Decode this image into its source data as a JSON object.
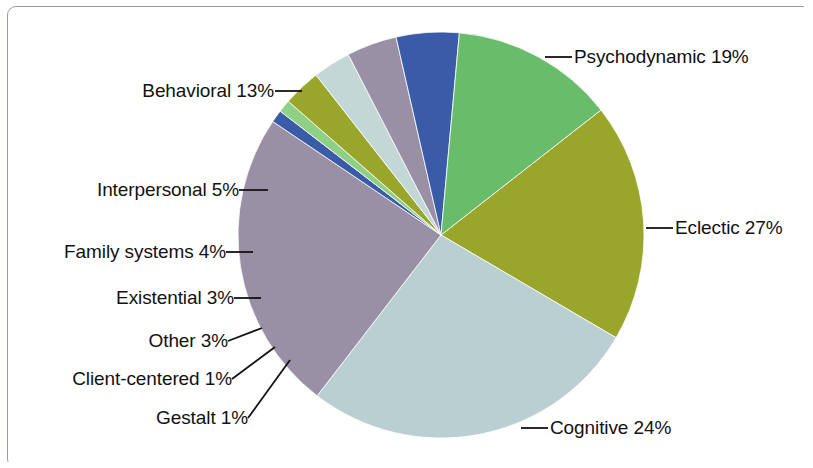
{
  "chart_data": {
    "type": "pie",
    "title": "",
    "subtitle": "",
    "xlabel": "",
    "ylabel": "",
    "grid": false,
    "legend_position": "none",
    "labels_format": "name percent",
    "units": "percent",
    "total": 100,
    "start_angle_deg": -38,
    "direction": "clockwise",
    "categories": [
      "Psychodynamic",
      "Eclectic",
      "Cognitive",
      "Gestalt",
      "Client-centered",
      "Other",
      "Existential",
      "Family systems",
      "Interpersonal",
      "Behavioral"
    ],
    "values": [
      19,
      27,
      24,
      1,
      1,
      3,
      3,
      4,
      5,
      13
    ],
    "colors": [
      "#9aa62b",
      "#b9cfd2",
      "#9a90a5",
      "#3a5ba8",
      "#8fcf86",
      "#9aa62b",
      "#c3d8d6",
      "#9a90a5",
      "#3a5ba8",
      "#68bc6a"
    ],
    "slices": [
      {
        "label": "Psychodynamic 19%",
        "name": "Psychodynamic",
        "value": 19,
        "color": "#9aa62b"
      },
      {
        "label": "Eclectic 27%",
        "name": "Eclectic",
        "value": 27,
        "color": "#b9cfd2"
      },
      {
        "label": "Cognitive 24%",
        "name": "Cognitive",
        "value": 24,
        "color": "#9a90a5"
      },
      {
        "label": "Gestalt 1%",
        "name": "Gestalt",
        "value": 1,
        "color": "#3a5ba8"
      },
      {
        "label": "Client-centered 1%",
        "name": "Client-centered",
        "value": 1,
        "color": "#8fcf86"
      },
      {
        "label": "Other 3%",
        "name": "Other",
        "value": 3,
        "color": "#9aa62b"
      },
      {
        "label": "Existential 3%",
        "name": "Existential",
        "value": 3,
        "color": "#c3d8d6"
      },
      {
        "label": "Family systems 4%",
        "name": "Family systems",
        "value": 4,
        "color": "#9a90a5"
      },
      {
        "label": "Interpersonal 5%",
        "name": "Interpersonal",
        "value": 5,
        "color": "#3a5ba8"
      },
      {
        "label": "Behavioral 13%",
        "name": "Behavioral",
        "value": 13,
        "color": "#68bc6a"
      }
    ]
  },
  "labels": {
    "psychodynamic": "Psychodynamic 19%",
    "eclectic": "Eclectic 27%",
    "cognitive": "Cognitive 24%",
    "gestalt": "Gestalt 1%",
    "client_centered": "Client-centered 1%",
    "other": "Other 3%",
    "existential": "Existential 3%",
    "family_systems": "Family systems 4%",
    "interpersonal": "Interpersonal 5%",
    "behavioral": "Behavioral 13%"
  },
  "style": {
    "background": "#ffffff",
    "frame_color": "#9b9ba3",
    "text_color": "#121212"
  }
}
